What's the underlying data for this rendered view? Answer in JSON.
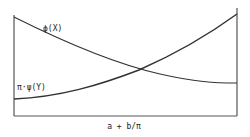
{
  "diagram": {
    "title": "",
    "x_axis_label": "a + b/π",
    "curves": [
      {
        "name": "phi-x",
        "label": "ϕ(X)",
        "trend": "decreasing",
        "shape": "convex"
      },
      {
        "name": "pi-psi-y",
        "label": "π·ψ(Y)",
        "trend": "increasing",
        "shape": "convex"
      }
    ],
    "intersection": "single crossing between curves"
  },
  "colors": {
    "line": "#333333",
    "frame": "#555555",
    "background": "#ffffff"
  }
}
